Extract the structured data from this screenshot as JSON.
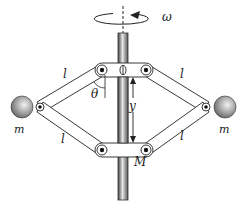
{
  "diagram": {
    "labels": {
      "omega": "ω",
      "l_upper_left": "l",
      "l_lower_left": "l",
      "l_upper_right": "l",
      "l_lower_right": "l",
      "theta": "θ",
      "y": "y",
      "m_left": "m",
      "m_right": "m",
      "M": "M"
    },
    "colors": {
      "line": "#222222",
      "rod_dark": "#555555",
      "rod_light": "#dddddd",
      "mass": "#9a9a9a"
    }
  }
}
